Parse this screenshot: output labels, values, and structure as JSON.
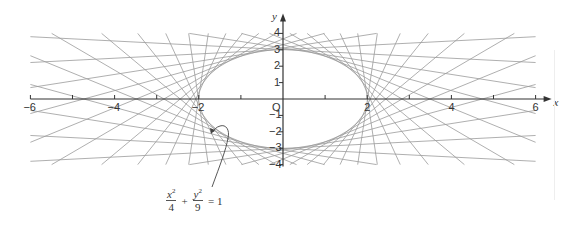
{
  "chart_data": {
    "type": "line",
    "title": "",
    "xlabel": "x",
    "ylabel": "y",
    "xlim": [
      -6,
      6
    ],
    "ylim": [
      -4,
      4
    ],
    "x_ticks": [
      -6,
      -5,
      -4,
      -3,
      -2,
      -1,
      0,
      1,
      2,
      3,
      4,
      5,
      6
    ],
    "x_tick_labels": [
      "-6",
      "-4",
      "-2",
      "2",
      "4",
      "6"
    ],
    "y_ticks": [
      -4,
      -3,
      -2,
      -1,
      1,
      2,
      3,
      4
    ],
    "y_tick_labels": [
      "4",
      "3",
      "2",
      "1",
      "-1",
      "-2",
      "-3",
      "-4"
    ],
    "origin_label": "O",
    "grid": false,
    "curve": {
      "a": 2,
      "b": 3,
      "equation": "x²/4 + y²/9 = 1"
    },
    "tangent_line_count": 36,
    "line_color": "#9a9a9a",
    "axis_color": "#333333"
  },
  "labels": {
    "x_axis": "x",
    "y_axis": "y",
    "origin": "O",
    "x_ticks": [
      {
        "v": -6,
        "t": "-6"
      },
      {
        "v": -4,
        "t": "-4"
      },
      {
        "v": -2,
        "t": "-2"
      },
      {
        "v": 2,
        "t": "2"
      },
      {
        "v": 4,
        "t": "4"
      },
      {
        "v": 6,
        "t": "6"
      }
    ],
    "y_ticks": [
      {
        "v": 4,
        "t": "4"
      },
      {
        "v": 3,
        "t": "3"
      },
      {
        "v": 2,
        "t": "2"
      },
      {
        "v": 1,
        "t": "1"
      },
      {
        "v": -1,
        "t": "-1"
      },
      {
        "v": -2,
        "t": "-2"
      },
      {
        "v": -3,
        "t": "-3"
      },
      {
        "v": -4,
        "t": "-4"
      }
    ]
  },
  "equation": {
    "x_num": "x",
    "x_den": "4",
    "plus": "+",
    "y_num": "y",
    "y_den": "9",
    "equals": "= 1",
    "exp": "2"
  }
}
